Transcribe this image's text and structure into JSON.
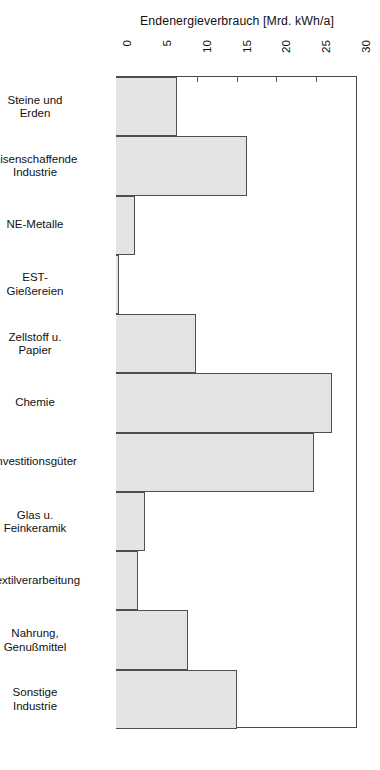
{
  "chart_data": {
    "type": "bar",
    "orientation": "horizontal",
    "title": "Endenergieverbrauch [Mrd. kWh/a]",
    "xlabel": "Endenergieverbrauch [Mrd. kWh/a]",
    "ylabel": "",
    "xlim": [
      0,
      30
    ],
    "xticks": [
      0,
      5,
      10,
      15,
      20,
      25,
      30
    ],
    "xtick_labels": [
      "0",
      "5",
      "10",
      "15",
      "20",
      "25",
      "30"
    ],
    "grid": false,
    "legend": null,
    "axis_position": "top",
    "tick_label_rotation": 90,
    "bar_fill_color": "#e4e4e4",
    "bar_edge_color": "#4f4f4f",
    "categories": [
      "Steine und Erden",
      "Eisenschaffende Industrie",
      "NE-Metalle",
      "EST-Gießereien",
      "Zellstoff u. Papier",
      "Chemie",
      "Investitionsgüter",
      "Glas u. Feinkeramik",
      "Textilverarbeitung",
      "Nahrung, Genußmittel",
      "Sonstige Industrie"
    ],
    "category_label_lines": [
      [
        "Steine  und",
        "Erden"
      ],
      [
        "Eisenschaffende",
        "Industrie"
      ],
      [
        "NE-Metalle"
      ],
      [
        "EST-",
        "Gießereien"
      ],
      [
        "Zellstoff u.",
        "Papier"
      ],
      [
        "Chemie"
      ],
      [
        "Investitionsgüter"
      ],
      [
        "Glas u.",
        "Feinkeramik"
      ],
      [
        "Textilverarbeitung"
      ],
      [
        "Nahrung,",
        "Genußmittel"
      ],
      [
        "Sonstige",
        "Industrie"
      ]
    ],
    "values": [
      7.7,
      16.4,
      2.4,
      0.35,
      10.1,
      27.1,
      24.9,
      3.6,
      2.7,
      9.0,
      15.2
    ]
  }
}
